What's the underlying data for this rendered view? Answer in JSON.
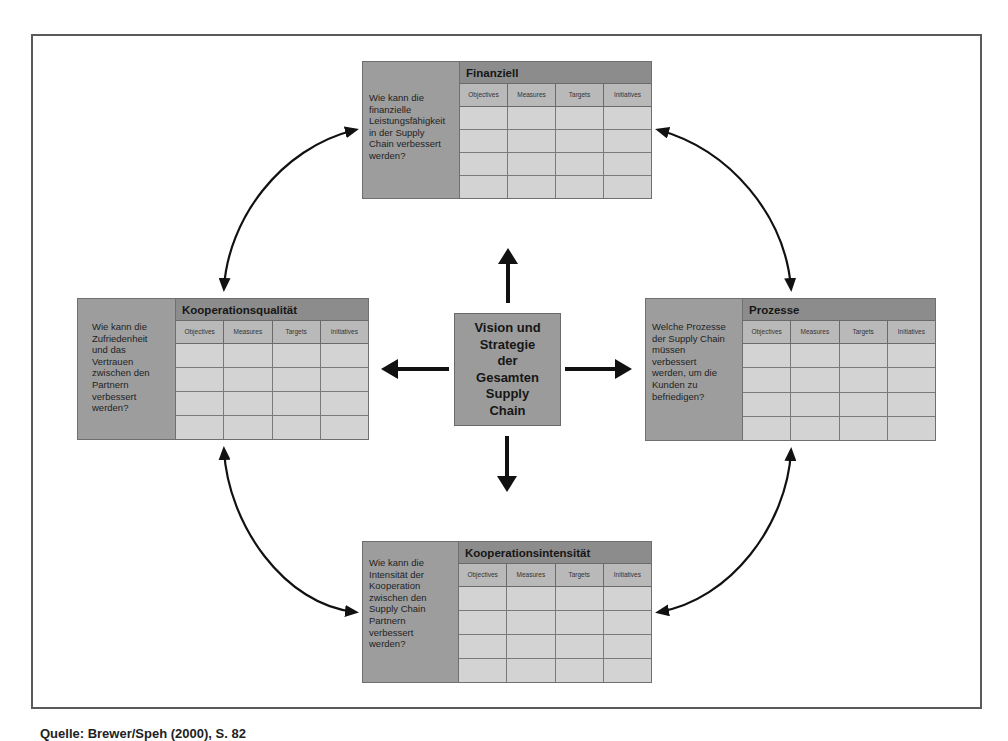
{
  "diagram": {
    "center": {
      "lines": [
        "Vision und",
        "Strategie",
        "der",
        "Gesamten",
        "Supply",
        "Chain"
      ]
    },
    "columns": [
      "Objectives",
      "Measures",
      "Targets",
      "Initiatives"
    ],
    "row_count": 4,
    "cards": {
      "finanziell": {
        "title": "Finanziell",
        "question_lines": [
          "Wie kann die",
          "finanzielle",
          "Leistungsfähigkeit",
          "in der Supply",
          "Chain verbessert",
          "werden?"
        ]
      },
      "qualitaet": {
        "title": "Kooperationsqualität",
        "question_lines": [
          "Wie kann die",
          "Zufriedenheit",
          "und das",
          "Vertrauen",
          "zwischen den",
          "Partnern",
          "verbessert",
          "werden?"
        ]
      },
      "prozesse": {
        "title": "Prozesse",
        "question_lines": [
          "Welche Prozesse",
          "der Supply Chain",
          "müssen",
          "verbessert",
          "werden, um die",
          "Kunden zu",
          "befriedigen?"
        ]
      },
      "intensitaet": {
        "title": "Kooperationsintensität",
        "question_lines": [
          "Wie kann die",
          "Intensität der",
          "Kooperation",
          "zwischen den",
          "Supply Chain",
          "Partnern",
          "verbessert",
          "werden?"
        ]
      }
    },
    "caption": "Quelle: Brewer/Speh (2000), S. 82"
  }
}
